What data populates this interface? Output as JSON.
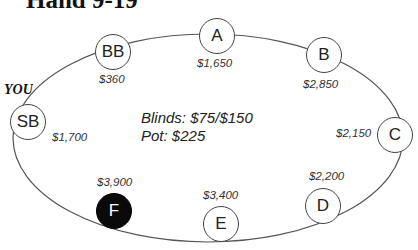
{
  "title": "Hand 9-19",
  "player_marker": "YOU",
  "table_info": {
    "blinds": "Blinds: $75/$150",
    "pot": "Pot: $225"
  },
  "seats": [
    {
      "label": "BB",
      "stack": "$360",
      "dealer": false
    },
    {
      "label": "A",
      "stack": "$1,650",
      "dealer": false
    },
    {
      "label": "B",
      "stack": "$2,850",
      "dealer": false
    },
    {
      "label": "C",
      "stack": "$2,150",
      "dealer": false
    },
    {
      "label": "D",
      "stack": "$2,200",
      "dealer": false
    },
    {
      "label": "E",
      "stack": "$3,400",
      "dealer": false
    },
    {
      "label": "F",
      "stack": "$3,900",
      "dealer": true
    },
    {
      "label": "SB",
      "stack": "$1,700",
      "dealer": false
    }
  ],
  "colors": {
    "dealer_fill": "#0a0a0a",
    "outline": "#444444"
  }
}
